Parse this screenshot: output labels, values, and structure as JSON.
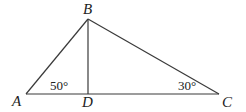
{
  "diagram": {
    "type": "triangle",
    "vertices": {
      "A": {
        "label": "A"
      },
      "B": {
        "label": "B"
      },
      "C": {
        "label": "C"
      },
      "D": {
        "label": "D"
      }
    },
    "angles": {
      "A": "50°",
      "C": "30°"
    },
    "segments": [
      "AB",
      "BC",
      "AC",
      "BD"
    ],
    "stroke_color": "#3a3a3a"
  }
}
